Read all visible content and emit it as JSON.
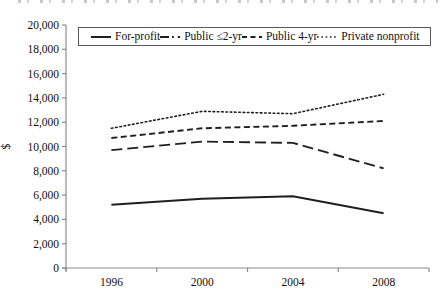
{
  "figure": {
    "background": "#ffffff",
    "axis_color": "#8c8c8c",
    "text_color": "#111111",
    "series_color": "#1f1f1f",
    "legend_border_color": "#595959"
  },
  "chart_data": {
    "type": "line",
    "title": "",
    "xlabel": "",
    "ylabel": "$",
    "categories": [
      "1996",
      "2000",
      "2004",
      "2008"
    ],
    "ylim": [
      0,
      20000
    ],
    "ytick_values": [
      0,
      2000,
      4000,
      6000,
      8000,
      10000,
      12000,
      14000,
      16000,
      18000,
      20000
    ],
    "ytick_labels": [
      "0",
      "2,000",
      "4,000",
      "6,000",
      "8,000",
      "10,000",
      "12,000",
      "14,000",
      "16,000",
      "18,000",
      "20,000"
    ],
    "grid": false,
    "legend_position": "top-inside-boxed",
    "series": [
      {
        "name": "For-profit",
        "style": "solid",
        "values": [
          5200,
          5700,
          5900,
          4500
        ]
      },
      {
        "name": "Public ≤2-yr",
        "style": "longdash-dot",
        "values": [
          9700,
          10400,
          10300,
          8200
        ]
      },
      {
        "name": "Public 4-yr",
        "style": "dash",
        "values": [
          10700,
          11500,
          11700,
          12100
        ]
      },
      {
        "name": "Private nonprofit",
        "style": "dot",
        "values": [
          11500,
          12900,
          12700,
          14300
        ]
      }
    ]
  }
}
